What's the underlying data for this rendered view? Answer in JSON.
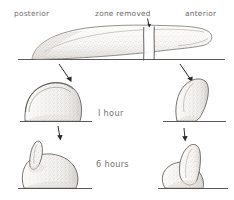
{
  "figure": {
    "style": "stippled pencil scientific illustration",
    "background_color": "#ffffff",
    "ink_color": "#4a4644",
    "label_color": "#6e6a67"
  },
  "labels": {
    "posterior": "posterior",
    "zone_removed": "zone removed",
    "anterior": "anterior",
    "one_hour": "I hour",
    "six_hours": "6 hours"
  },
  "rows": [
    {
      "name": "top-row",
      "description": "Full elongated limb bud in lateral view resting on a baseline, tapering from a low broad posterior end to a rounded anterior tip. Two short vertical cut lines near the anterior end bracket an excised strip.",
      "shapes": [
        {
          "name": "intact-limb-bud",
          "description": "long low wedge, stippled interior, baseline beneath"
        },
        {
          "name": "removed-zone-marker",
          "description": "pair of vertical lines with a small downward arrow above the gap"
        }
      ]
    },
    {
      "name": "one-hour-row",
      "time_label": "I hour",
      "shapes": [
        {
          "name": "posterior-fragment-1h",
          "description": "broad rounded dome with a crescent cap ridge along the upper-left edge, stippled, sitting on a baseline"
        },
        {
          "name": "anterior-fragment-1h",
          "description": "narrow upright finger leaning right with a rounded tip, stippled, sitting on a baseline"
        }
      ],
      "arrows": [
        {
          "name": "arrow-to-posterior-fragment",
          "direction": "down-right"
        },
        {
          "name": "arrow-to-anterior-fragment",
          "direction": "down-right"
        }
      ]
    },
    {
      "name": "six-hours-row",
      "time_label": "6 hours",
      "shapes": [
        {
          "name": "posterior-fragment-6h",
          "description": "rounded bulb with a pointed conical outgrowth emerging from the upper-left shoulder"
        },
        {
          "name": "anterior-fragment-6h",
          "description": "broad base with a tall tapering cone rising from it, rounded apex"
        }
      ],
      "arrows": [
        {
          "name": "arrow-to-posterior-6h",
          "direction": "down"
        },
        {
          "name": "arrow-to-anterior-6h",
          "direction": "down"
        }
      ]
    }
  ]
}
